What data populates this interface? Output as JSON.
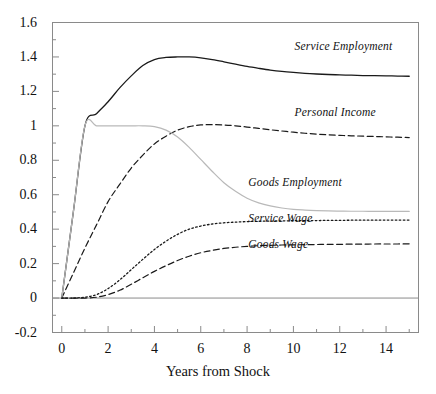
{
  "chart_data": {
    "type": "line",
    "title": "",
    "xlabel": "Years from Shock",
    "ylabel": "",
    "xlim": [
      -0.4,
      15.4
    ],
    "ylim": [
      -0.2,
      1.6
    ],
    "grid": false,
    "legend_position": "inline-annotations",
    "xticks": [
      0,
      2,
      4,
      6,
      8,
      10,
      12,
      14
    ],
    "xtick_labels": [
      "0",
      "2",
      "4",
      "6",
      "8",
      "10",
      "12",
      "14"
    ],
    "xminor_ticks": [
      1,
      3,
      5,
      7,
      9,
      11,
      13,
      15
    ],
    "yticks": [
      -0.2,
      0,
      0.2,
      0.4,
      0.6,
      0.8,
      1,
      1.2,
      1.4,
      1.6
    ],
    "ytick_labels": [
      "-0.2",
      "0",
      "0.2",
      "0.4",
      "0.6",
      "0.8",
      "1",
      "1.2",
      "1.4",
      "1.6"
    ],
    "yminor_ticks": [
      -0.1,
      0.1,
      0.3,
      0.5,
      0.7,
      0.9,
      1.1,
      1.3,
      1.5
    ],
    "zero_line": 0,
    "x": [
      0,
      0.5,
      1,
      1.5,
      2,
      2.5,
      3,
      3.5,
      4,
      4.5,
      5,
      5.5,
      6,
      6.5,
      7,
      7.5,
      8,
      8.5,
      9,
      9.5,
      10,
      10.5,
      11,
      11.5,
      12,
      12.5,
      13,
      13.5,
      14,
      14.5,
      15
    ],
    "series": [
      {
        "name": "Service Employment",
        "style": "solid",
        "color": "#1a1a1a",
        "width": 1.3,
        "label_x": 10.05,
        "label_y": 1.45,
        "values": [
          0.0,
          0.5,
          1.0,
          1.07,
          1.14,
          1.22,
          1.29,
          1.35,
          1.385,
          1.397,
          1.4,
          1.4,
          1.395,
          1.385,
          1.372,
          1.358,
          1.345,
          1.334,
          1.324,
          1.316,
          1.31,
          1.305,
          1.301,
          1.298,
          1.296,
          1.294,
          1.292,
          1.291,
          1.29,
          1.289,
          1.288
        ]
      },
      {
        "name": "Personal Income",
        "style": "dashed",
        "color": "#1a1a1a",
        "width": 1.2,
        "label_x": 10.05,
        "label_y": 1.07,
        "values": [
          0.0,
          0.145,
          0.29,
          0.425,
          0.56,
          0.66,
          0.755,
          0.83,
          0.895,
          0.94,
          0.975,
          0.995,
          1.005,
          1.007,
          1.005,
          1.0,
          0.993,
          0.985,
          0.977,
          0.97,
          0.963,
          0.957,
          0.952,
          0.948,
          0.945,
          0.942,
          0.94,
          0.938,
          0.936,
          0.934,
          0.932
        ]
      },
      {
        "name": "Goods Employment",
        "style": "solid",
        "color": "#b9b9b9",
        "width": 1.2,
        "label_x": 8.05,
        "label_y": 0.66,
        "values": [
          0.0,
          0.5,
          1.0,
          1.0,
          1.0,
          1.0,
          1.0,
          1.0,
          0.995,
          0.975,
          0.935,
          0.875,
          0.805,
          0.735,
          0.67,
          0.62,
          0.58,
          0.553,
          0.535,
          0.523,
          0.515,
          0.511,
          0.508,
          0.506,
          0.505,
          0.504,
          0.504,
          0.503,
          0.503,
          0.503,
          0.503
        ]
      },
      {
        "name": "Service Wage",
        "style": "dotted",
        "color": "#1a1a1a",
        "width": 1.3,
        "label_x": 8.05,
        "label_y": 0.455,
        "values": [
          0.0,
          0.0,
          0.005,
          0.02,
          0.055,
          0.105,
          0.165,
          0.225,
          0.282,
          0.33,
          0.37,
          0.4,
          0.418,
          0.43,
          0.437,
          0.441,
          0.444,
          0.446,
          0.447,
          0.448,
          0.449,
          0.45,
          0.45,
          0.451,
          0.451,
          0.452,
          0.452,
          0.452,
          0.453,
          0.453,
          0.453
        ]
      },
      {
        "name": "Goods Wage",
        "style": "dashed",
        "color": "#1a1a1a",
        "width": 1.2,
        "label_x": 8.05,
        "label_y": 0.3,
        "values": [
          0.0,
          0.0,
          0.0,
          0.005,
          0.02,
          0.045,
          0.08,
          0.118,
          0.155,
          0.188,
          0.218,
          0.243,
          0.263,
          0.277,
          0.288,
          0.295,
          0.3,
          0.304,
          0.306,
          0.308,
          0.309,
          0.31,
          0.311,
          0.312,
          0.312,
          0.313,
          0.313,
          0.314,
          0.314,
          0.314,
          0.315
        ]
      }
    ]
  }
}
